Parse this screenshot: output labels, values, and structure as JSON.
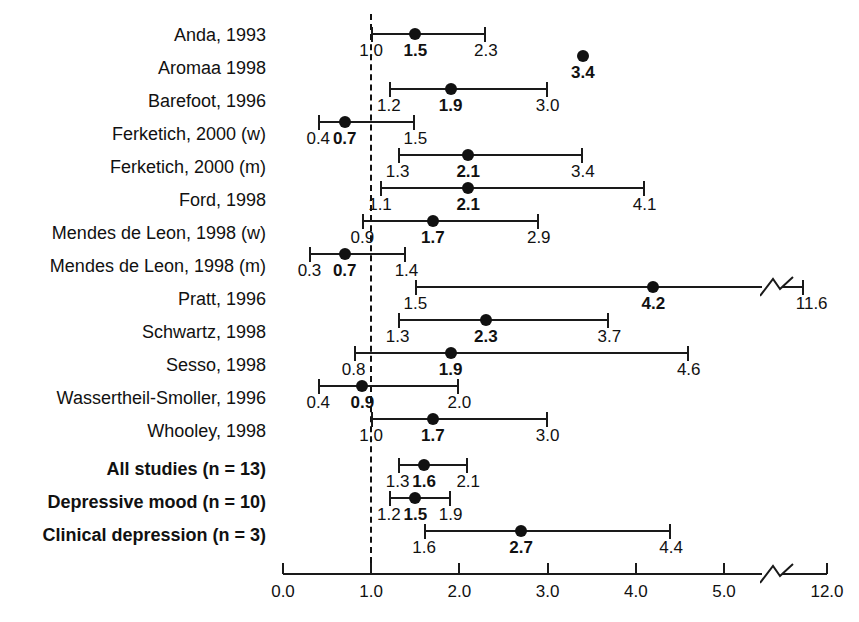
{
  "figure": {
    "type": "forest-plot",
    "background": "#ffffff",
    "foreground": "#111111",
    "reference_value": 1.0
  },
  "chart_data": {
    "type": "scatter",
    "subtype": "forest-plot",
    "title": "",
    "xlabel": "",
    "ylabel": "",
    "xlim": [
      0.0,
      12.0
    ],
    "grid": false,
    "legend": false,
    "reference_line": 1.0,
    "axis_break": {
      "from": 5.3,
      "to": 11.4
    },
    "xticks": [
      "0.0",
      "1.0",
      "2.0",
      "3.0",
      "4.0",
      "5.0",
      "12.0"
    ],
    "xtick_values": [
      0.0,
      1.0,
      2.0,
      3.0,
      4.0,
      5.0,
      12.0
    ],
    "categories": [
      "Anda, 1993",
      "Aromaa 1998",
      "Barefoot, 1996",
      "Ferketich, 2000 (w)",
      "Ferketich, 2000 (m)",
      "Ford, 1998",
      "Mendes de Leon, 1998 (w)",
      "Mendes de Leon, 1998 (m)",
      "Pratt, 1996",
      "Schwartz, 1998",
      "Sesso, 1998",
      "Wassertheil-Smoller, 1996",
      "Whooley, 1998",
      "All studies (n = 13)",
      "Depressive mood (n = 10)",
      "Clinical depression (n = 3)"
    ],
    "estimates": [
      1.5,
      3.4,
      1.9,
      0.7,
      2.1,
      2.1,
      1.7,
      0.7,
      4.2,
      2.3,
      1.9,
      0.9,
      1.7,
      1.6,
      1.5,
      2.7
    ],
    "ci_low": [
      1.0,
      null,
      1.2,
      0.4,
      1.3,
      1.1,
      0.9,
      0.3,
      1.5,
      1.3,
      0.8,
      0.4,
      1.0,
      1.3,
      1.2,
      1.6
    ],
    "ci_high": [
      2.3,
      null,
      3.0,
      1.5,
      3.4,
      4.1,
      2.9,
      1.4,
      11.6,
      3.7,
      4.6,
      2.0,
      3.0,
      2.1,
      1.9,
      4.4
    ]
  },
  "rows": [
    {
      "label": "Anda, 1993",
      "low": "1.0",
      "est": "1.5",
      "high": "2.3",
      "summary": false,
      "broken": false,
      "ci": true
    },
    {
      "label": "Aromaa 1998",
      "low": "",
      "est": "3.4",
      "high": "",
      "summary": false,
      "broken": false,
      "ci": false
    },
    {
      "label": "Barefoot, 1996",
      "low": "1.2",
      "est": "1.9",
      "high": "3.0",
      "summary": false,
      "broken": false,
      "ci": true
    },
    {
      "label": "Ferketich, 2000 (w)",
      "low": "0.4",
      "est": "0.7",
      "high": "1.5",
      "summary": false,
      "broken": false,
      "ci": true
    },
    {
      "label": "Ferketich, 2000 (m)",
      "low": "1.3",
      "est": "2.1",
      "high": "3.4",
      "summary": false,
      "broken": false,
      "ci": true
    },
    {
      "label": "Ford, 1998",
      "low": "1.1",
      "est": "2.1",
      "high": "4.1",
      "summary": false,
      "broken": false,
      "ci": true
    },
    {
      "label": "Mendes de Leon, 1998 (w)",
      "low": "0.9",
      "est": "1.7",
      "high": "2.9",
      "summary": false,
      "broken": false,
      "ci": true
    },
    {
      "label": "Mendes de Leon, 1998 (m)",
      "low": "0.3",
      "est": "0.7",
      "high": "1.4",
      "summary": false,
      "broken": false,
      "ci": true
    },
    {
      "label": "Pratt, 1996",
      "low": "1.5",
      "est": "4.2",
      "high": "11.6",
      "summary": false,
      "broken": true,
      "ci": true
    },
    {
      "label": "Schwartz, 1998",
      "low": "1.3",
      "est": "2.3",
      "high": "3.7",
      "summary": false,
      "broken": false,
      "ci": true
    },
    {
      "label": "Sesso, 1998",
      "low": "0.8",
      "est": "1.9",
      "high": "4.6",
      "summary": false,
      "broken": false,
      "ci": true
    },
    {
      "label": "Wassertheil-Smoller, 1996",
      "low": "0.4",
      "est": "0.9",
      "high": "2.0",
      "summary": false,
      "broken": false,
      "ci": true
    },
    {
      "label": "Whooley, 1998",
      "low": "1.0",
      "est": "1.7",
      "high": "3.0",
      "summary": false,
      "broken": false,
      "ci": true
    },
    {
      "label": "All studies (n = 13)",
      "low": "1.3",
      "est": "1.6",
      "high": "2.1",
      "summary": true,
      "broken": false,
      "ci": true
    },
    {
      "label": "Depressive mood (n = 10)",
      "low": "1.2",
      "est": "1.5",
      "high": "1.9",
      "summary": true,
      "broken": false,
      "ci": true
    },
    {
      "label": "Clinical depression (n = 3)",
      "low": "1.6",
      "est": "2.7",
      "high": "4.4",
      "summary": true,
      "broken": false,
      "ci": true
    }
  ],
  "axis": {
    "ticks": [
      "0.0",
      "1.0",
      "2.0",
      "3.0",
      "4.0",
      "5.0",
      "12.0"
    ]
  }
}
